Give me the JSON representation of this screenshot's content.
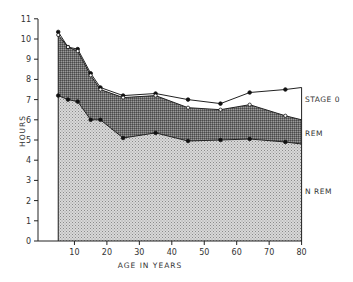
{
  "chart_data": {
    "type": "area",
    "title": "",
    "xlabel": "AGE IN YEARS",
    "ylabel": "HOURS",
    "xlim": [
      0,
      80
    ],
    "ylim": [
      0,
      11
    ],
    "x_ticks": [
      "10",
      "20",
      "30",
      "40",
      "50",
      "60",
      "70",
      "80"
    ],
    "y_ticks": [
      "0",
      "1",
      "2",
      "3",
      "4",
      "5",
      "6",
      "7",
      "8",
      "9",
      "10",
      "11"
    ],
    "grid": false,
    "stacked": true,
    "x": [
      5,
      8,
      11,
      15,
      18,
      25,
      35,
      45,
      55,
      64,
      75,
      80
    ],
    "series": [
      {
        "name": "N REM",
        "marker": "filled-circle",
        "fill": "light-stipple",
        "values": [
          7.2,
          7.0,
          6.9,
          6.0,
          6.0,
          5.1,
          5.35,
          4.95,
          5.0,
          5.05,
          4.9,
          4.8
        ]
      },
      {
        "name": "REM",
        "marker": "open-circle",
        "fill": "dark-crosshatch",
        "values": [
          10.2,
          9.6,
          9.4,
          8.2,
          7.5,
          7.1,
          7.2,
          6.6,
          6.5,
          6.75,
          6.2,
          6.0
        ]
      },
      {
        "name": "STAGE 0",
        "marker": "filled-circle",
        "fill": "none",
        "values": [
          10.35,
          9.6,
          9.5,
          8.3,
          7.6,
          7.2,
          7.3,
          7.0,
          6.8,
          7.35,
          7.5,
          7.6
        ]
      }
    ],
    "annotations": [
      "STAGE 0",
      "REM",
      "N REM"
    ]
  },
  "labels": {
    "ylabel": "HOURS",
    "xlabel": "AGE IN YEARS",
    "stage0": "STAGE 0",
    "rem": "REM",
    "nrem": "N REM"
  }
}
